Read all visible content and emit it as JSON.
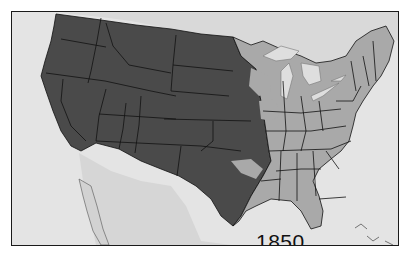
{
  "map": {
    "title_year": "1850",
    "subject": "United States territorial map",
    "colors": {
      "western_territory": "#4a4a4a",
      "eastern_states": "#a9a9a9",
      "background_land_water": "#e4e4e4",
      "great_lakes": "#d8d8d8",
      "borders": "#111111",
      "frame": "#1a1a1a"
    },
    "legend": []
  }
}
